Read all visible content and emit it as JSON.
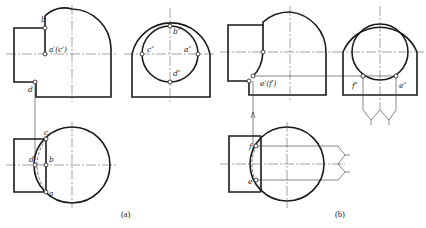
{
  "figure": {
    "panels": [
      {
        "id": "a",
        "caption": "(a)",
        "front_view_labels": {
          "b": "b",
          "a_c": "a′(c′)",
          "d": "d"
        },
        "side_view_labels": {
          "b": "b″",
          "c": "c″",
          "a": "a″",
          "d": "d″"
        },
        "top_view_labels": {
          "c": "c",
          "d": "d",
          "b": "b",
          "a": "a"
        }
      },
      {
        "id": "b",
        "caption": "(b)",
        "front_view_labels": {
          "e_f": "e′(f′)"
        },
        "side_view_labels": {
          "f": "f″",
          "e": "e″"
        },
        "top_view_labels": {
          "f": "f",
          "e": "e"
        }
      }
    ]
  }
}
